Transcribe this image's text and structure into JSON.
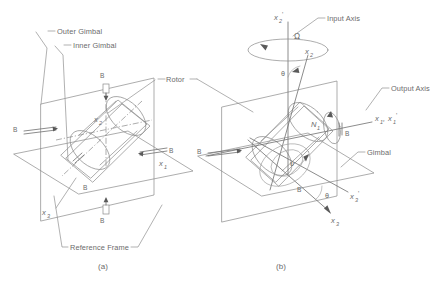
{
  "figure": {
    "panels": [
      {
        "id": "a",
        "caption": "(a)",
        "labels": {
          "outer_gimbal": "Outer Gimbal",
          "inner_gimbal": "Inner Gimbal",
          "rotor": "Rotor",
          "reference_frame": "Reference Frame"
        },
        "bearings": [
          {
            "id": "b-top",
            "label": "B"
          },
          {
            "id": "b-left",
            "label": "B"
          },
          {
            "id": "b-right",
            "label": "B"
          },
          {
            "id": "b-inner",
            "label": "B"
          },
          {
            "id": "b-bottom",
            "label": "B"
          }
        ],
        "axes": [
          {
            "id": "x1",
            "base": "x",
            "sub": "1",
            "prime": ""
          },
          {
            "id": "x2",
            "base": "x",
            "sub": "2",
            "prime": ""
          },
          {
            "id": "x3",
            "base": "x",
            "sub": "3",
            "prime": ""
          }
        ]
      },
      {
        "id": "b",
        "caption": "(b)",
        "labels": {
          "input_axis": "Input Axis",
          "output_axis": "Output Axis",
          "gimbal": "Gimbal"
        },
        "bearings": [
          {
            "id": "b-right",
            "label": "B"
          },
          {
            "id": "b-left",
            "label": "B"
          },
          {
            "id": "b-bottom",
            "label": "B"
          }
        ],
        "axes": [
          {
            "id": "x2p",
            "base": "x",
            "sub": "2",
            "prime": "'"
          },
          {
            "id": "x2",
            "base": "x",
            "sub": "2",
            "prime": ""
          },
          {
            "id": "x1x1p",
            "base": "x",
            "sub": "1",
            "prime": "",
            "label_full": "x1, x1'"
          },
          {
            "id": "x3p",
            "base": "x",
            "sub": "3",
            "prime": "'"
          },
          {
            "id": "x3",
            "base": "x",
            "sub": "3",
            "prime": ""
          }
        ],
        "symbols": [
          {
            "id": "omega-input",
            "glyph": "Ω",
            "meaning": "input-angular-rate"
          },
          {
            "id": "omega-spin",
            "glyph": "υ",
            "meaning": "rotor-spin"
          },
          {
            "id": "theta-top",
            "glyph": "θ",
            "meaning": "gimbal-angle"
          },
          {
            "id": "theta-bottom",
            "glyph": "θ",
            "meaning": "gimbal-angle"
          },
          {
            "id": "torque-n1",
            "glyph": "N",
            "sub": "1",
            "meaning": "output-torque"
          }
        ]
      }
    ],
    "colors": {
      "line": "#8a8a8a",
      "text": "#6b6b6b",
      "background": "#ffffff"
    }
  }
}
